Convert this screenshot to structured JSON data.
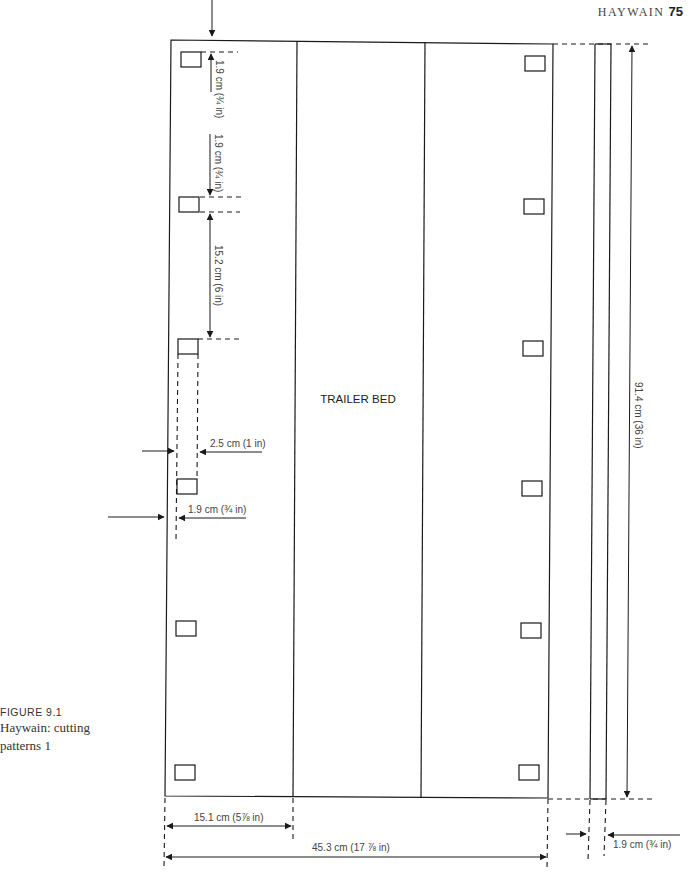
{
  "header": {
    "running_title": "HAYWAIN",
    "page_number": "75"
  },
  "caption": {
    "figure_number": "FIGURE 9.1",
    "text_line1": "Haywain: cutting",
    "text_line2": "patterns 1"
  },
  "diagram": {
    "part_label": "TRAILER BED",
    "dimensions": {
      "slot_top_offset": "1.9 cm (¾ in)",
      "slot_height": "1.9 cm (¾ in)",
      "slot_spacing": "15.2 cm (6 in)",
      "slot_width": "2.5 cm (1 in)",
      "slot_inset": "1.9 cm (¾ in)",
      "panel_width": "15.1 cm (5⅞ in)",
      "total_width": "45.3 cm (17 ⅞ in)",
      "total_length": "91.4 cm (36 in)",
      "strip_width": "1.9 cm (¾ in)"
    }
  }
}
